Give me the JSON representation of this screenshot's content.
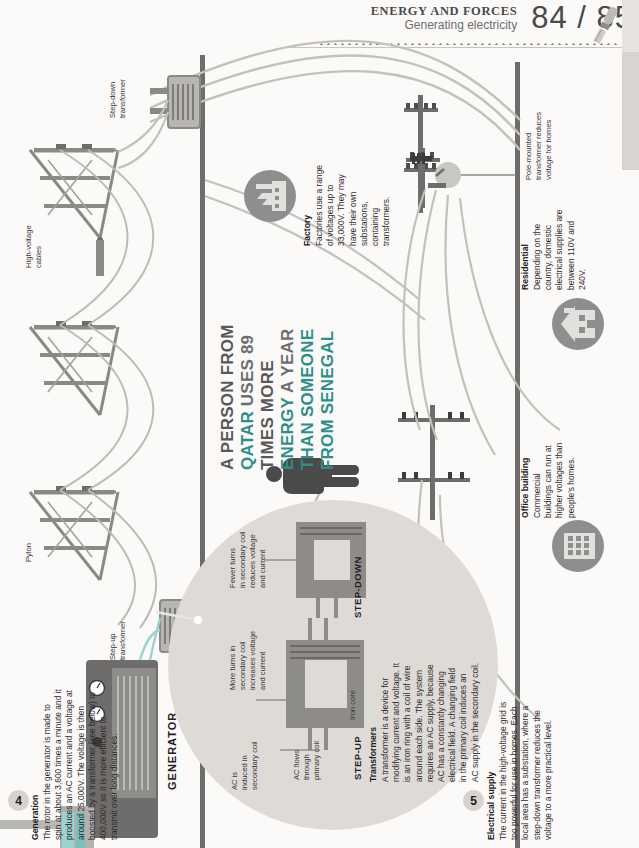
{
  "header": {
    "section_title": "ENERGY AND FORCES",
    "subtitle": "Generating electricity",
    "page_numbers": "84 / 85",
    "page_left": "84",
    "page_sep": "/",
    "page_right": "85"
  },
  "quote": {
    "line1": "A PERSON FROM",
    "line2_a": "QATAR",
    "line2_b": "USES 89",
    "line3": "TIMES MORE",
    "line4_a": "ENERGY",
    "line4_b": "A YEAR",
    "line5": "THAN SOMEONE",
    "line6": "FROM SENEGAL"
  },
  "steps": [
    {
      "number": "4",
      "title": "Generation",
      "body": "The rotor in the generator is made to spin at about 3,600 times a minute and it produces an AC current and a voltage at around 25,000V. The voltage is then boosted by a transformer (see below) to 400,000V so it is more efficient to transmit over long distances."
    },
    {
      "number": "5",
      "title": "Electrical supply",
      "body": "The current in the high-voltage grid is too powerful for use in homes. Each local area has a substation, where a step-down transformer reduces the voltage to a more practical level."
    }
  ],
  "callouts": [
    {
      "title": "Factory",
      "body": "Factories use a range of voltages up to 33,000V. They may have their own substations, containing transformers."
    },
    {
      "title": "Residential",
      "body": "Depending on the country, domestic electrical supplies are between 110V and 240V."
    },
    {
      "title": "Office building",
      "body": "Commercial buildings can run at higher voltages than people's homes."
    }
  ],
  "labels": {
    "step_down_transformer": "Step-down\ntransformer",
    "step_down_transformer_l1": "Step-down",
    "step_down_transformer_l2": "transformer",
    "high_voltage_cables_l1": "High-voltage",
    "high_voltage_cables_l2": "cables",
    "pylon": "Pylon",
    "step_up_transformer_l1": "Step-up",
    "step_up_transformer_l2": "transformer",
    "pole_mounted_l1": "Pole-mounted",
    "pole_mounted_l2": "transformer reduces",
    "pole_mounted_l3": "voltage for homes",
    "generator": "GENERATOR"
  },
  "transformer_panel": {
    "title": "Transformers",
    "body": "A transformer is a device for modifying current and voltage. It is an iron ring with a coil of wire around each side. The system requires an AC supply, because AC has a constantly changing electrical field. A changing field in the primary coil induces an AC supply in the secondary coil.",
    "step_up_label": "STEP-UP",
    "step_down_label": "STEP-DOWN",
    "ann_iron_core": "Iron core",
    "ann_ac_flows_l1": "AC flows",
    "ann_ac_flows_l2": "through",
    "ann_ac_flows_l3": "primary coil",
    "ann_ac_induced_l1": "AC is",
    "ann_ac_induced_l2": "induced in",
    "ann_ac_induced_l3": "secondary coil",
    "ann_more_turns_l1": "More turns in",
    "ann_more_turns_l2": "secondary coil",
    "ann_more_turns_l3": "increases voltage",
    "ann_more_turns_l4": "and current",
    "ann_fewer_turns_l1": "Fewer turns",
    "ann_fewer_turns_l2": "in secondary coil",
    "ann_fewer_turns_l3": "reduces voltage",
    "ann_fewer_turns_l4": "and current"
  },
  "colors": {
    "accent_teal": "#2c8f8a",
    "quote_grey": "#58595b",
    "icon_circle": "#8e8e8e",
    "panel_bg": "#dedbd7",
    "page_bg": "#fbfaf8",
    "wire": "#b9b7b4",
    "structure": "#6f6d6b"
  }
}
